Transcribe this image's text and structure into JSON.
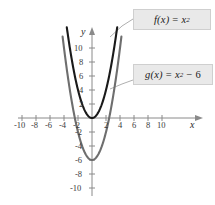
{
  "figure": {
    "title": "",
    "background_color": "#ffffff"
  },
  "callouts": {
    "f": {
      "fn": "f(x)",
      "eq": "=",
      "base": "x",
      "exp": "2",
      "tail": "",
      "full_text": "f(x) = x2",
      "background_color": "#e9e9e9",
      "border_color": "#cfcfcf"
    },
    "g": {
      "fn": "g(x)",
      "eq": "=",
      "base": "x",
      "exp": "2",
      "tail": "− 6",
      "full_text": "g(x) = x2 − 6",
      "background_color": "#e9e9e9",
      "border_color": "#cfcfcf"
    }
  },
  "axes": {
    "x_label": "x",
    "y_label": "y",
    "x_ticks": [
      -10,
      -8,
      -6,
      -4,
      -2,
      2,
      4,
      6,
      8,
      10
    ],
    "y_ticks": [
      10,
      8,
      6,
      4,
      2,
      -2,
      -4,
      -6,
      -8,
      -10
    ],
    "x_tick_labels": [
      "-10",
      "-8",
      "-6",
      "-4",
      "-2",
      "2",
      "4",
      "6",
      "8",
      "10"
    ],
    "y_tick_labels": [
      "10",
      "8",
      "6",
      "4",
      "2",
      "-2",
      "-4",
      "-6",
      "-8",
      "-10"
    ],
    "xlim": [
      -12,
      12
    ],
    "ylim": [
      -12,
      12
    ],
    "grid": false,
    "axis_color": "#8a8a8a"
  },
  "chart_data": {
    "type": "line",
    "title": "",
    "xlabel": "x",
    "ylabel": "y",
    "xlim": [
      -12,
      12
    ],
    "ylim": [
      -12,
      12
    ],
    "grid": false,
    "legend_position": "callout-boxes",
    "categories": [],
    "series": [
      {
        "name": "f(x) = x2",
        "expression": "x^2",
        "color": "#1a1a1a",
        "line_width": 2.1,
        "vertex": [
          0,
          0
        ],
        "x": [
          -3.6,
          -3.2,
          -2.8,
          -2.4,
          -2.0,
          -1.6,
          -1.2,
          -0.8,
          -0.4,
          0,
          0.4,
          0.8,
          1.2,
          1.6,
          2.0,
          2.4,
          2.8,
          3.2,
          3.6
        ],
        "values": [
          12.96,
          10.24,
          7.84,
          5.76,
          4.0,
          2.56,
          1.44,
          0.64,
          0.16,
          0,
          0.16,
          0.64,
          1.44,
          2.56,
          4.0,
          5.76,
          7.84,
          10.24,
          12.96
        ]
      },
      {
        "name": "g(x) = x2 - 6",
        "expression": "x^2 - 6",
        "color": "#6e6e6e",
        "line_width": 2.1,
        "vertex": [
          0,
          -6
        ],
        "x_intercepts": [
          -2.449,
          2.449
        ],
        "x": [
          -4.2,
          -3.8,
          -3.4,
          -3.0,
          -2.6,
          -2.2,
          -1.8,
          -1.4,
          -1.0,
          -0.6,
          -0.2,
          0,
          0.2,
          0.6,
          1.0,
          1.4,
          1.8,
          2.2,
          2.6,
          3.0,
          3.4,
          3.8,
          4.2
        ],
        "values": [
          11.64,
          8.44,
          5.56,
          3.0,
          0.76,
          -1.16,
          -2.76,
          -4.04,
          -5.0,
          -5.64,
          -5.96,
          -6,
          -5.96,
          -5.64,
          -5.0,
          -4.04,
          -2.76,
          -1.16,
          0.76,
          3.0,
          5.56,
          8.44,
          11.64
        ]
      }
    ],
    "annotations": [
      {
        "text": "f(x) = x2",
        "target_series": "f(x) = x2"
      },
      {
        "text": "g(x) = x2 - 6",
        "target_series": "g(x) = x2 - 6"
      }
    ]
  }
}
